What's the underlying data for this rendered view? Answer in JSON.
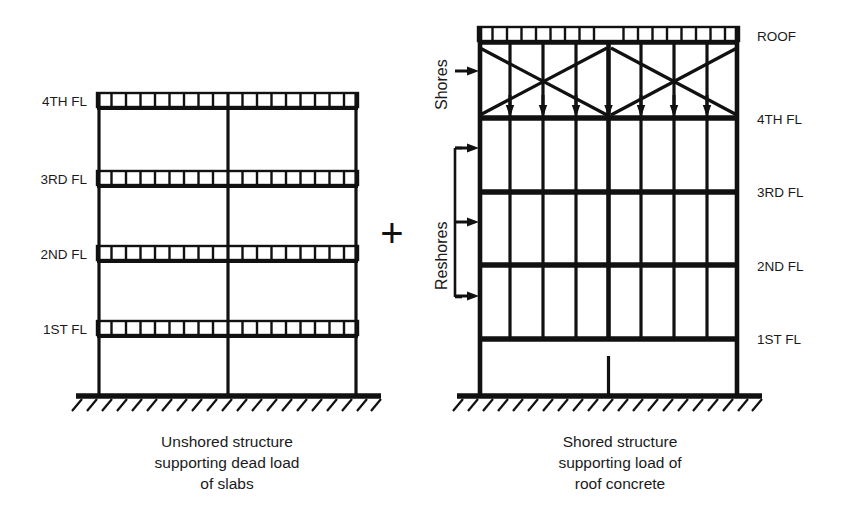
{
  "diagram": {
    "operator": "+",
    "line_color": "#111111",
    "background": "#ffffff"
  },
  "left_structure": {
    "caption_lines": [
      "Unshored structure",
      "supporting dead load",
      "of slabs"
    ],
    "floor_labels": [
      "4TH FL",
      "3RD FL",
      "2ND FL",
      "1ST FL"
    ],
    "bays": 2,
    "slab_cells_per_bay": 9,
    "has_ground_hatch": true
  },
  "right_structure": {
    "caption_lines": [
      "Shored structure",
      "supporting load of",
      "roof concrete"
    ],
    "floor_labels": [
      "ROOF",
      "4TH FL",
      "3RD FL",
      "2ND FL",
      "1ST FL"
    ],
    "bays": 2,
    "slab_cells_per_bay": 9,
    "shore_label": "Shores",
    "reshore_label": "Reshores",
    "shore_arrow_count": 1,
    "reshore_arrow_count": 3,
    "load_arrows_at_4th_floor": 7,
    "braced_bays": 2,
    "reshore_stories": 3,
    "posts_per_reshore_story": 7,
    "has_ground_hatch": true
  }
}
